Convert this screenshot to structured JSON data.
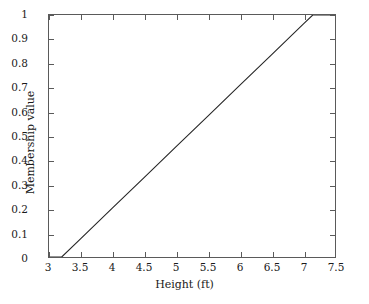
{
  "chart_data": {
    "type": "line",
    "title": "",
    "xlabel": "Height (ft)",
    "ylabel": "Membership value",
    "xlim": [
      3,
      7.5
    ],
    "ylim": [
      0,
      1
    ],
    "grid": false,
    "legend": null,
    "xticks": [
      "3",
      "3.5",
      "4",
      "4.5",
      "5",
      "5.5",
      "6",
      "6.5",
      "7",
      "7.5"
    ],
    "xtick_values": [
      3,
      3.5,
      4,
      4.5,
      5,
      5.5,
      6,
      6.5,
      7,
      7.5
    ],
    "yticks": [
      "0",
      "0.1",
      "0.2",
      "0.3",
      "0.4",
      "0.5",
      "0.6",
      "0.7",
      "0.8",
      "0.9",
      "1"
    ],
    "ytick_values": [
      0,
      0.1,
      0.2,
      0.3,
      0.4,
      0.5,
      0.6,
      0.7,
      0.8,
      0.9,
      1
    ],
    "series": [
      {
        "name": "Tall membership",
        "color": "#262626",
        "x": [
          3.0,
          3.2,
          3.5,
          4.0,
          4.5,
          5.0,
          5.5,
          6.0,
          6.5,
          7.0,
          7.15,
          7.5
        ],
        "y": [
          0.0,
          0.0,
          0.076,
          0.203,
          0.329,
          0.456,
          0.582,
          0.709,
          0.835,
          0.962,
          1.0,
          1.0
        ]
      }
    ],
    "annotations": []
  },
  "axes": {
    "frame_color": "#5a5a5a",
    "background": "#ffffff"
  }
}
